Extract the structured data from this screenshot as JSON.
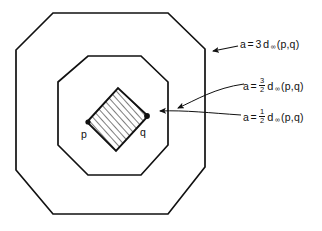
{
  "figure": {
    "background_color": "#ffffff",
    "stroke_color": "#111111",
    "hatch_color": "#111111"
  },
  "point_labels": {
    "p": "p",
    "q": "q"
  },
  "annotations": [
    {
      "id": "outer",
      "variable": "a",
      "equals": "=",
      "coefficient": "3",
      "fraction": null,
      "metric": "d",
      "subscript": "∞",
      "args": "(p,q)",
      "target": "outer-octagon"
    },
    {
      "id": "middle",
      "variable": "a",
      "equals": "=",
      "coefficient": null,
      "fraction": {
        "numerator": "3",
        "denominator": "2"
      },
      "metric": "d",
      "subscript": "∞",
      "args": "(p,q)",
      "target": "middle-octagon"
    },
    {
      "id": "inner",
      "variable": "a",
      "equals": "=",
      "coefficient": null,
      "fraction": {
        "numerator": "1",
        "denominator": "2"
      },
      "metric": "d",
      "subscript": "∞",
      "args": "(p,q)",
      "target": "inner-diamond"
    }
  ],
  "shapes": {
    "outer_octagon": {
      "name": "outer-octagon",
      "points": "53,13 168,13 205,49 205,167 168,214 53,214 16,170 16,50"
    },
    "middle_octagon": {
      "name": "middle-octagon",
      "points": "88,56 141,56 168,82 168,145 141,175 88,175 58,145 58,82"
    },
    "inner_diamond": {
      "name": "inner-diamond",
      "points": "87,122 118,88 148,116 116,151"
    }
  }
}
